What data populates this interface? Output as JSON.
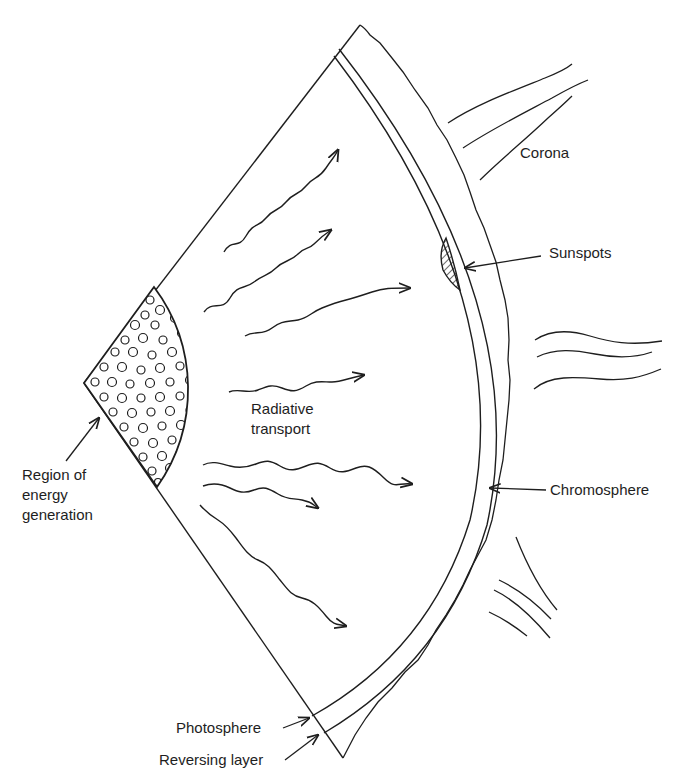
{
  "figure": {
    "labels": {
      "corona": "Corona",
      "sunspots": "Sunspots",
      "radiative_line1": "Radiative",
      "radiative_line2": "transport",
      "region_line1": "Region of",
      "region_line2": "energy",
      "region_line3": "generation",
      "chromosphere": "Chromosphere",
      "photosphere": "Photosphere",
      "reversing_layer": "Reversing layer"
    },
    "colors": {
      "ink": "#1e1e1e",
      "background": "#ffffff"
    }
  }
}
